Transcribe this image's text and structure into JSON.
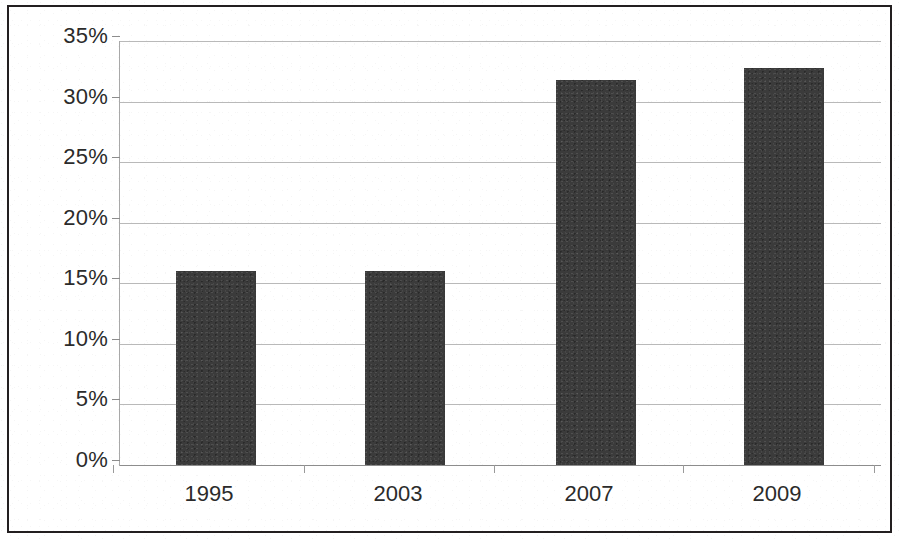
{
  "chart_data": {
    "type": "bar",
    "title": "",
    "subtitle": "",
    "xlabel": "",
    "ylabel": "",
    "categories": [
      "1995",
      "2003",
      "2007",
      "2009"
    ],
    "values": [
      16,
      16,
      31.8,
      32.8
    ],
    "value_labels": [
      "16%",
      "16%",
      "32%",
      "33%"
    ],
    "ylim": [
      0,
      35
    ],
    "ytick_values": [
      0,
      5,
      10,
      15,
      20,
      25,
      30,
      35
    ],
    "ytick_labels": [
      "0%",
      "5%",
      "10%",
      "15%",
      "20%",
      "25%",
      "30%",
      "35%"
    ],
    "grid": true,
    "legend": false,
    "legend_position": "none",
    "series": [
      {
        "name": "",
        "values": [
          16,
          16,
          31.8,
          32.8
        ]
      }
    ],
    "colors": {
      "bar_fill": "#3b3b3b",
      "gridline": "#b9b9b9",
      "axis": "#8d8d8d",
      "frame": "#231f20",
      "text": "#2b2b2b",
      "background": "#ffffff"
    }
  }
}
